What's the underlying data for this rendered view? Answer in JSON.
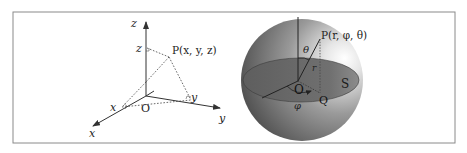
{
  "figure": {
    "cartesian": {
      "axis_labels": {
        "x": "x",
        "y": "y",
        "z": "z"
      },
      "origin_label": "O",
      "point_label": "P(x, y, z)",
      "projection_labels": {
        "x": "x",
        "y": "y",
        "z": "z"
      }
    },
    "spherical": {
      "point_label": "P(r, φ, θ)",
      "origin_label": "O",
      "projection_label": "Q",
      "plane_label": "S",
      "radius_label": "r",
      "polar_angle_label": "θ",
      "azimuth_label": "φ"
    }
  },
  "colors": {
    "frame": "#8a8a8a",
    "axis": "#333333",
    "sphere_dark": "#5a5a5a",
    "sphere_light": "#f4f4f4",
    "disk": "#6b6b6b"
  }
}
